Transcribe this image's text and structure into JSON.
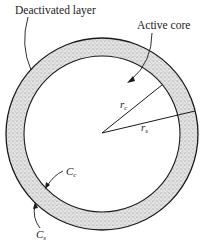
{
  "diagram": {
    "labels": {
      "deactivated_layer": "Deactivated layer",
      "active_core": "Active core",
      "r_c_main": "r",
      "r_c_sub": "c",
      "r_s_main": "r",
      "r_s_sub": "s",
      "C_c_main": "C",
      "C_c_sub": "c",
      "C_s_main": "C",
      "C_s_sub": "s"
    },
    "colors": {
      "line": "#1a1a1a",
      "shell_fill": "#d9d9d9",
      "background": "#ffffff"
    },
    "geometry": {
      "center": [
        102,
        134
      ],
      "outer_radius": 96,
      "inner_radius": 78
    }
  }
}
